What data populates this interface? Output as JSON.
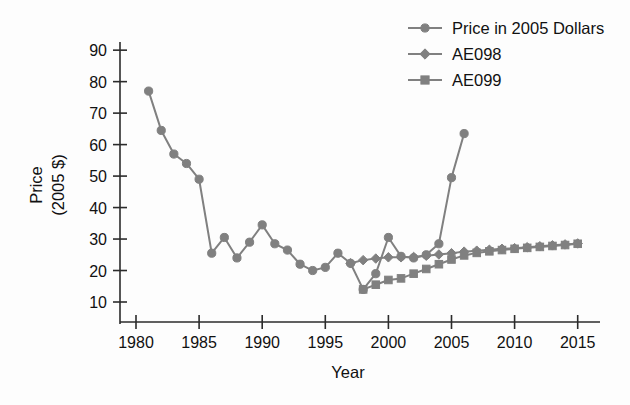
{
  "chart_data": {
    "type": "line",
    "title": "",
    "xlabel": "Year",
    "ylabel": "Price\n(2005 $)",
    "ylabel_line1": "Price",
    "ylabel_line2": "(2005 $)",
    "xlim": [
      1978.5,
      2016.5
    ],
    "ylim": [
      5,
      95
    ],
    "xticks": [
      1980,
      1985,
      1990,
      1995,
      2000,
      2005,
      2010,
      2015
    ],
    "yticks": [
      10,
      20,
      30,
      40,
      50,
      60,
      70,
      80,
      90
    ],
    "grid": false,
    "legend_position": "top-right",
    "series": [
      {
        "name": "Price in 2005 Dollars",
        "marker": "circle",
        "color": "#808080",
        "x": [
          1981,
          1982,
          1983,
          1984,
          1985,
          1986,
          1987,
          1988,
          1989,
          1990,
          1991,
          1992,
          1993,
          1994,
          1995,
          1996,
          1997,
          1998,
          1999,
          2000,
          2001,
          2002,
          2003,
          2004,
          2005,
          2006
        ],
        "values": [
          77.0,
          64.5,
          57.0,
          54.0,
          49.0,
          25.5,
          30.5,
          24.0,
          29.0,
          34.5,
          28.5,
          26.5,
          22.0,
          20.0,
          21.0,
          25.5,
          22.3,
          14.0,
          19.0,
          30.5,
          24.5,
          24.0,
          25.0,
          28.5,
          49.5,
          63.5
        ]
      },
      {
        "name": "AE098",
        "marker": "diamond",
        "color": "#808080",
        "x": [
          1997,
          1998,
          1999,
          2000,
          2001,
          2002,
          2003,
          2004,
          2005,
          2006,
          2007,
          2008,
          2009,
          2010,
          2011,
          2012,
          2013,
          2014,
          2015
        ],
        "values": [
          22.3,
          23.3,
          23.8,
          24.2,
          24.2,
          24.3,
          24.7,
          25.1,
          25.5,
          26.0,
          26.3,
          26.6,
          26.9,
          27.1,
          27.4,
          27.7,
          28.0,
          28.3,
          28.6
        ]
      },
      {
        "name": "AE099",
        "marker": "square",
        "color": "#808080",
        "x": [
          1998,
          1999,
          2000,
          2001,
          2002,
          2003,
          2004,
          2005,
          2006,
          2007,
          2008,
          2009,
          2010,
          2011,
          2012,
          2013,
          2014,
          2015
        ],
        "values": [
          14.0,
          15.5,
          17.0,
          17.5,
          19.0,
          20.5,
          22.0,
          23.5,
          24.8,
          25.6,
          26.1,
          26.5,
          26.9,
          27.2,
          27.5,
          27.8,
          28.1,
          28.5
        ]
      }
    ]
  },
  "legend": {
    "items": [
      {
        "label": "Price in 2005 Dollars",
        "marker": "circle"
      },
      {
        "label": "AE098",
        "marker": "diamond"
      },
      {
        "label": "AE099",
        "marker": "square"
      }
    ]
  },
  "axes": {
    "x_title": "Year",
    "y_title_line1": "Price",
    "y_title_line2": "(2005 $)",
    "x_tick_labels": [
      "1980",
      "1985",
      "1990",
      "1995",
      "2000",
      "2005",
      "2010",
      "2015"
    ],
    "y_tick_labels": [
      "90",
      "80",
      "70",
      "60",
      "50",
      "40",
      "30",
      "20",
      "10"
    ]
  },
  "colors": {
    "series": "#808080",
    "axis": "#2b2b2b",
    "text": "#111111",
    "background": "#fdfdfd"
  }
}
